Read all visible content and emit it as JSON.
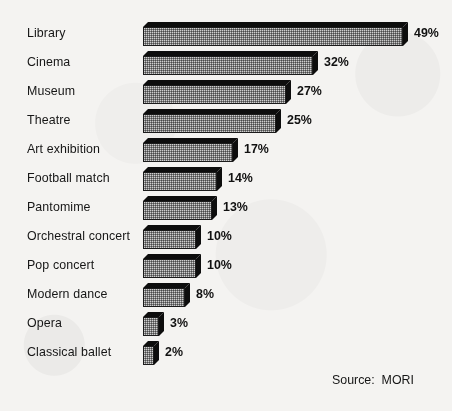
{
  "chart_data": {
    "type": "bar",
    "orientation": "horizontal",
    "title": "",
    "xlabel": "",
    "ylabel": "",
    "xlim": [
      0,
      49
    ],
    "grid": false,
    "legend": null,
    "value_suffix": "%",
    "categories": [
      "Library",
      "Cinema",
      "Museum",
      "Theatre",
      "Art exhibition",
      "Football match",
      "Pantomime",
      "Orchestral concert",
      "Pop concert",
      "Modern dance",
      "Opera",
      "Classical ballet"
    ],
    "values": [
      49,
      32,
      27,
      25,
      17,
      14,
      13,
      10,
      10,
      8,
      3,
      2
    ],
    "value_labels": [
      "49%",
      "32%",
      "27%",
      "25%",
      "17%",
      "14%",
      "13%",
      "10%",
      "10%",
      "8%",
      "3%",
      "2%"
    ],
    "annotations": [
      "Source:  MORI"
    ]
  },
  "source": {
    "text": "Source:  MORI"
  },
  "colors": {
    "background": "#f4f3f1",
    "bar_face": "#cfcfcf",
    "bar_shadow": "#0d0d0d",
    "bar_outline": "#1b1b1b",
    "text": "#161616"
  }
}
